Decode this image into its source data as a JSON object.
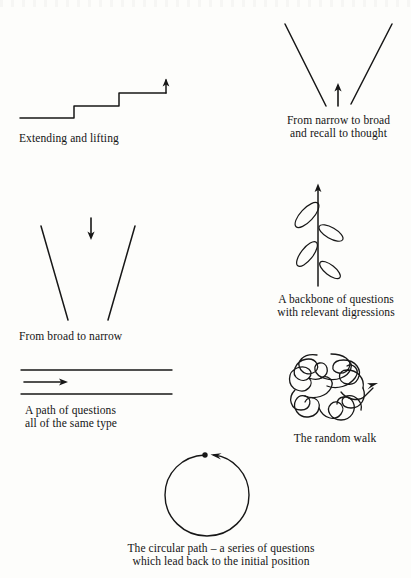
{
  "page": {
    "background_color": "#fdfdfb",
    "ink_color": "#171717",
    "width": 411,
    "height": 578
  },
  "figures": [
    {
      "id": "extending-and-lifting",
      "icon": "staircase-rising-arrow-icon",
      "caption": "Extending and lifting",
      "caption_lines": [
        "Extending and lifting"
      ],
      "description": "A rising staircase line of three treads ending in an upward arrow"
    },
    {
      "id": "narrow-to-broad",
      "icon": "v-shape-opening-upward-icon",
      "caption": "From narrow to broad\nand recall to thought",
      "caption_lines": [
        "From narrow to broad",
        "and recall to thought"
      ],
      "description": "Two lines forming a V that widens upward with a small up arrow in the middle"
    },
    {
      "id": "broad-to-narrow",
      "icon": "funnel-narrowing-downward-icon",
      "caption": "From broad to narrow",
      "caption_lines": [
        "From broad to narrow"
      ],
      "description": "Two lines converging downward with a small down arrow at the top"
    },
    {
      "id": "backbone-of-questions",
      "icon": "backbone-with-leaf-loops-icon",
      "caption": "A backbone of questions\nwith relevant digressions",
      "caption_lines": [
        "A backbone of questions",
        "with relevant digressions"
      ],
      "description": "A vertical upward arrow with four elongated loop digressions branching alternately"
    },
    {
      "id": "path-of-questions",
      "icon": "parallel-rails-right-arrow-icon",
      "caption": "A path of questions\nall of the same type",
      "caption_lines": [
        "A path of questions",
        "all of the same type"
      ],
      "description": "Two parallel horizontal lines with a short right-pointing arrow between them"
    },
    {
      "id": "random-walk",
      "icon": "tangled-scribble-arrow-icon",
      "caption": "The random walk",
      "caption_lines": [
        "The random walk"
      ],
      "description": "A dense tangled wandering line ending in an arrowhead"
    },
    {
      "id": "circular-path",
      "icon": "circle-with-return-arrow-icon",
      "caption": "The circular path – a series of questions\nwhich lead back to the initial position",
      "caption_lines": [
        "The circular path – a series of questions",
        "which lead back to the initial position"
      ],
      "description": "A near-closed circle with a start dot at top and an arrowhead returning to it"
    }
  ]
}
